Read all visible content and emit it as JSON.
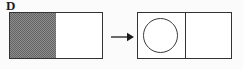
{
  "figure": {
    "label": "D",
    "background_color": "#fbfbfb",
    "stroke_color": "#333333",
    "shade_color": "#8e8e8e",
    "caption": ""
  },
  "before": {
    "name": "before-rectangle",
    "left_half_state": "shaded",
    "right_half_state": "empty",
    "shade_pattern": "checkerboard-stipple"
  },
  "arrow": {
    "name": "transform-arrow",
    "direction": "right",
    "glyph": "arrow-right-icon"
  },
  "after": {
    "name": "after-rectangle",
    "left_half_state": "circle",
    "right_half_state": "empty",
    "divider": "vertical-line",
    "shape": "circle-outline"
  }
}
